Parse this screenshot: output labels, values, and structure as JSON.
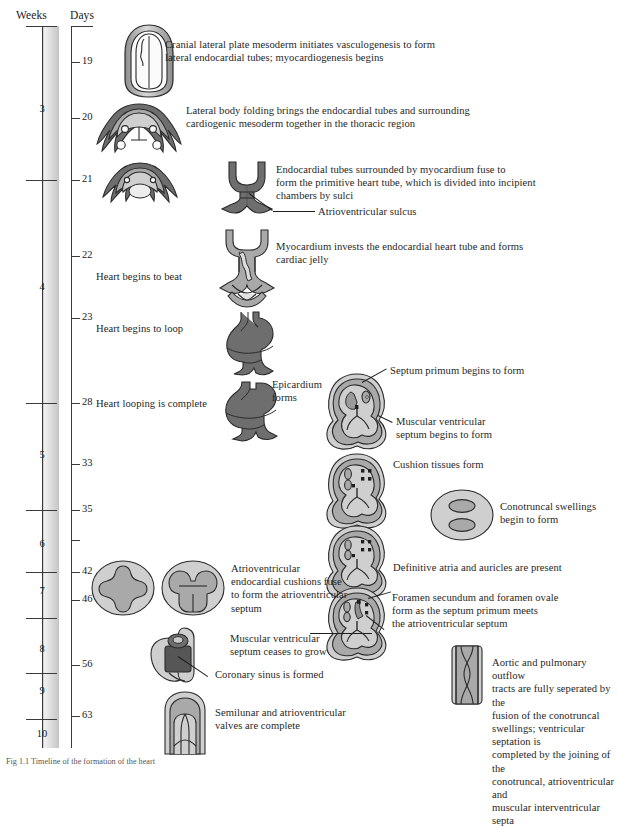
{
  "figure": {
    "title_axis_weeks": "Weeks",
    "title_axis_days": "Days",
    "caption": "Fig 1.1  Timeline of the formation of the heart"
  },
  "axis": {
    "weeks": [
      {
        "label": "3",
        "y": 110
      },
      {
        "label": "4",
        "y": 288
      },
      {
        "label": "5",
        "y": 456
      },
      {
        "label": "6",
        "y": 545
      },
      {
        "label": "7",
        "y": 592
      },
      {
        "label": "8",
        "y": 650
      },
      {
        "label": "9",
        "y": 692
      },
      {
        "label": "10",
        "y": 735
      }
    ],
    "week_ticks": [
      26,
      180,
      403,
      510,
      572,
      618,
      673,
      719
    ],
    "days": [
      {
        "label": "19",
        "y": 62
      },
      {
        "label": "20",
        "y": 118
      },
      {
        "label": "21",
        "y": 180
      },
      {
        "label": "22",
        "y": 256
      },
      {
        "label": "23",
        "y": 318
      },
      {
        "label": "28",
        "y": 403
      },
      {
        "label": "33",
        "y": 464
      },
      {
        "label": "35",
        "y": 510
      },
      {
        "label": "42",
        "y": 572
      },
      {
        "label": "46",
        "y": 600
      },
      {
        "label": "56",
        "y": 665
      },
      {
        "label": "63",
        "y": 716
      }
    ],
    "day_ticks": [
      62,
      118,
      180,
      256,
      318,
      403,
      464,
      510,
      540,
      572,
      600,
      665,
      716
    ]
  },
  "notes": {
    "n1": "Cranial lateral plate mesoderm initiates vasculogenesis to form\nlateral endocardial tubes; myocardiogenesis begins",
    "n2": "Lateral body folding brings the endocardial tubes and surrounding\ncardiogenic mesoderm together in the thoracic region",
    "n3": "Endocardial tubes surrounded by myocardium fuse to\nform the primitive heart tube, which is divided into incipient\nchambers by sulci",
    "n4": "Atrioventricular sulcus",
    "n5": "Myocardium invests the endocardial heart tube and forms\ncardiac jelly",
    "n6": "Heart begins to beat",
    "n7": "Heart begins to loop",
    "n8": "Heart looping is complete",
    "n9": "Epicardium\nforms",
    "n10": "Septum primum begins to form",
    "n11": "Muscular ventricular\nseptum begins to form",
    "n12": "Cushion tissues form",
    "n13": "Conotruncal swellings\nbegin to form",
    "n14": "Definitive atria and auricles are present",
    "n15": "Atrioventricular\nendocardial cushions fuse\nto form the atrioventricular\nseptum",
    "n16": "Foramen secundum and foramen ovale\nform as the septum primum meets\nthe atrioventricular septum",
    "n17": "Muscular ventricular\nseptum ceases to grow",
    "n18": "Coronary sinus is formed",
    "n19": "Aortic and pulmonary outflow\ntracts are fully seperated by the\nfusion of the conotruncal\nswellings; ventricular septation is\ncompleted by the joining of the\nconotruncal, atrioventricular and\nmuscular interventricular septa",
    "n20": "Semilunar and atrioventricular\nvalves are complete"
  },
  "colors": {
    "dark_grey": "#6e6e6e",
    "mid_grey": "#a9a9a9",
    "light_grey": "#cfcfcf",
    "pale_grey": "#e2e2e2",
    "outline": "#2b2b2b",
    "axis_band": "#dcdcdc"
  },
  "illustrations": [
    {
      "name": "neural-plate-cardiogenic-field",
      "day": "19"
    },
    {
      "name": "lateral-body-folding-section",
      "day": "20"
    },
    {
      "name": "body-folding-section-2",
      "day": "21"
    },
    {
      "name": "primitive-heart-tube",
      "day": "21"
    },
    {
      "name": "myocardium-cardiac-jelly-tube",
      "day": "22"
    },
    {
      "name": "looping-heart-tube",
      "day": "23"
    },
    {
      "name": "looped-heart-epicardium",
      "day": "28"
    },
    {
      "name": "heart-section-septum-primum",
      "day": "33"
    },
    {
      "name": "heart-section-cushion-tissues",
      "day": "35"
    },
    {
      "name": "conotruncal-swellings-oval",
      "day": "35"
    },
    {
      "name": "heart-section-definitive-atria",
      "day": "42"
    },
    {
      "name": "heart-section-foramen-ovale",
      "day": "46"
    },
    {
      "name": "av-cushions-open",
      "day": "42"
    },
    {
      "name": "av-cushions-fused",
      "day": "46"
    },
    {
      "name": "coronary-sinus",
      "day": "56"
    },
    {
      "name": "aortic-pulmonary-outflow",
      "day": "56"
    },
    {
      "name": "semilunar-valves",
      "day": "63"
    }
  ]
}
